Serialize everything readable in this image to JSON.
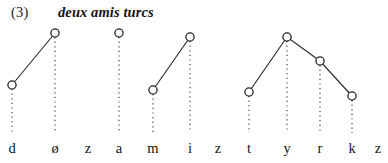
{
  "figure": {
    "caption_number": "(3)",
    "caption_gloss": "deux amis turcs",
    "background_color": "#ffffff",
    "node_stroke_color": "#232323",
    "node_fill_color": "#ffffff",
    "contour_line_color": "#2b2b2b",
    "association_line_color": "#4a4a4a",
    "label_color": "#141414"
  },
  "chart_data": {
    "type": "line",
    "title": "deux amis turcs",
    "xlabel": "",
    "ylabel": "",
    "grid": false,
    "legend": "none",
    "xlim": [
      0,
      388
    ],
    "ylim": [
      163,
      0
    ],
    "note": "Pitch / tone target contour aligned to segmental tier. Each tone target is an open circle connected downward by a dotted association line to its segment label. Higher circle = higher pitch target. Segments without a circle bear no tone target.",
    "categories": [
      "d",
      "ø",
      "z",
      "a",
      "m",
      "i",
      "z",
      "t",
      "y",
      "r",
      "k",
      "z"
    ],
    "x": [
      12,
      55,
      88,
      119,
      153,
      190,
      218,
      249,
      287,
      320,
      352,
      378
    ],
    "values": [
      85,
      33,
      null,
      33,
      90,
      37,
      null,
      92,
      37,
      61,
      96,
      null
    ],
    "pitch_levels": [
      "mid-low",
      "high",
      null,
      "high",
      "mid-low",
      "high",
      null,
      "mid-low",
      "high",
      "mid-high",
      "low",
      null
    ],
    "nodes": [
      {
        "label": "d",
        "x": 12,
        "y": 85,
        "has_target": true
      },
      {
        "label": "ø",
        "x": 55,
        "y": 33,
        "has_target": true
      },
      {
        "label": "z",
        "x": 88,
        "y": null,
        "has_target": false
      },
      {
        "label": "a",
        "x": 119,
        "y": 33,
        "has_target": true
      },
      {
        "label": "m",
        "x": 153,
        "y": 90,
        "has_target": true
      },
      {
        "label": "i",
        "x": 190,
        "y": 37,
        "has_target": true
      },
      {
        "label": "z",
        "x": 218,
        "y": null,
        "has_target": false
      },
      {
        "label": "t",
        "x": 249,
        "y": 92,
        "has_target": true
      },
      {
        "label": "y",
        "x": 287,
        "y": 37,
        "has_target": true
      },
      {
        "label": "r",
        "x": 320,
        "y": 61,
        "has_target": true
      },
      {
        "label": "k",
        "x": 352,
        "y": 96,
        "has_target": true
      },
      {
        "label": "z",
        "x": 378,
        "y": null,
        "has_target": false
      }
    ],
    "series": [
      {
        "name": "contour-1",
        "points": [
          [
            12,
            85
          ],
          [
            55,
            33
          ]
        ]
      },
      {
        "name": "contour-2",
        "points": [
          [
            153,
            90
          ],
          [
            190,
            37
          ]
        ]
      },
      {
        "name": "contour-3",
        "points": [
          [
            249,
            92
          ],
          [
            287,
            37
          ],
          [
            320,
            61
          ],
          [
            352,
            96
          ]
        ]
      }
    ],
    "association_lines": [
      {
        "label": "d",
        "x": 12,
        "y_top": 89,
        "y_bottom": 133
      },
      {
        "label": "ø",
        "x": 55,
        "y_top": 37,
        "y_bottom": 133
      },
      {
        "label": "a",
        "x": 119,
        "y_top": 37,
        "y_bottom": 133
      },
      {
        "label": "m",
        "x": 153,
        "y_top": 94,
        "y_bottom": 133
      },
      {
        "label": "i",
        "x": 190,
        "y_top": 41,
        "y_bottom": 133
      },
      {
        "label": "t",
        "x": 249,
        "y_top": 96,
        "y_bottom": 133
      },
      {
        "label": "y",
        "x": 287,
        "y_top": 41,
        "y_bottom": 133
      },
      {
        "label": "r",
        "x": 320,
        "y_top": 65,
        "y_bottom": 133
      },
      {
        "label": "k",
        "x": 352,
        "y_top": 100,
        "y_bottom": 133
      }
    ]
  }
}
